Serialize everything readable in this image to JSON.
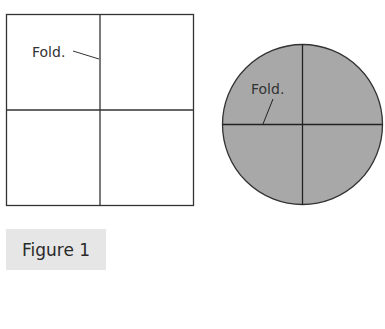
{
  "figure": {
    "caption": "Figure 1",
    "square": {
      "label": "Fold.",
      "fill": "#ffffff",
      "stroke": "#333333"
    },
    "circle": {
      "label": "Fold.",
      "fill": "#a8a8a8",
      "stroke": "#333333"
    },
    "caption_bg": "#e6e6e6"
  }
}
